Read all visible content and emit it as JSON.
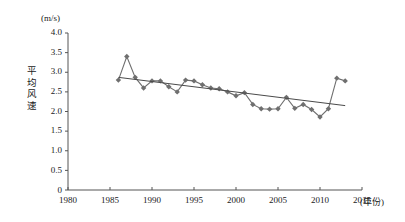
{
  "chart_data": {
    "type": "line",
    "title": "",
    "xlabel": "(年份)",
    "ylabel": "平均风速",
    "yunit": "(m/s)",
    "xlim": [
      1980,
      2015
    ],
    "ylim": [
      0,
      4.0
    ],
    "grid": false,
    "legend": "none",
    "xticks": [
      "1980",
      "1985",
      "1990",
      "1995",
      "2000",
      "2005",
      "2010",
      "2015"
    ],
    "xtick_values": [
      1980,
      1985,
      1990,
      1995,
      2000,
      2005,
      2010,
      2015
    ],
    "yticks": [
      "0",
      "0.5",
      "1.0",
      "1.5",
      "2.0",
      "2.5",
      "3.0",
      "3.5",
      "4.0"
    ],
    "ytick_values": [
      0,
      0.5,
      1.0,
      1.5,
      2.0,
      2.5,
      3.0,
      3.5,
      4.0
    ],
    "marker": "diamond",
    "series": [
      {
        "name": "平均风速",
        "color": "#6f6f6f",
        "x": [
          1986,
          1987,
          1988,
          1989,
          1990,
          1991,
          1992,
          1993,
          1994,
          1995,
          1996,
          1997,
          1998,
          1999,
          2000,
          2001,
          2002,
          2003,
          2004,
          2005,
          2006,
          2007,
          2008,
          2009,
          2010,
          2011,
          2012,
          2013
        ],
        "values": [
          2.8,
          3.4,
          2.87,
          2.6,
          2.78,
          2.78,
          2.63,
          2.5,
          2.8,
          2.78,
          2.68,
          2.6,
          2.58,
          2.5,
          2.4,
          2.48,
          2.18,
          2.07,
          2.06,
          2.07,
          2.36,
          2.08,
          2.18,
          2.05,
          1.86,
          2.07,
          2.85,
          2.78
        ]
      }
    ],
    "trendline": {
      "name": "线性趋势线",
      "color": "#4a4a4a",
      "x_start": 1986,
      "x_end": 2013,
      "y_start": 2.87,
      "y_end": 2.15
    }
  },
  "axes": {
    "x_axis_name": "year-axis",
    "y_axis_name": "wind-speed-axis"
  }
}
